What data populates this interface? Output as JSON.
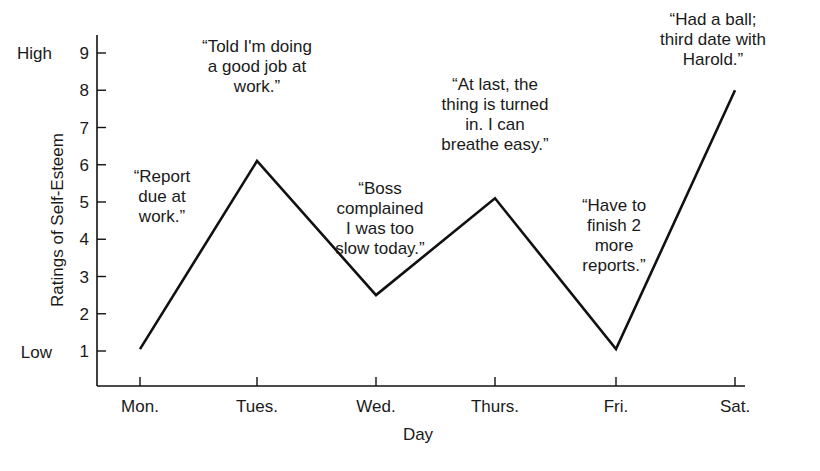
{
  "chart_data": {
    "type": "line",
    "title": "",
    "xlabel": "Day",
    "ylabel": "Ratings of Self-Esteem",
    "categories": [
      "Mon.",
      "Tues.",
      "Wed.",
      "Thurs.",
      "Fri.",
      "Sat."
    ],
    "values": [
      1.05,
      6.1,
      2.5,
      5.1,
      1.05,
      8.0
    ],
    "ylim": [
      0,
      9.8
    ],
    "yticks": [
      1,
      2,
      3,
      4,
      5,
      6,
      7,
      8,
      9
    ],
    "ytick_extra_labels": {
      "1": "Low",
      "9": "High"
    },
    "grid": false,
    "legend": null,
    "annotations": [
      {
        "day": "Mon.",
        "lines": [
          "“Report",
          "due at",
          "work.”"
        ]
      },
      {
        "day": "Tues.",
        "lines": [
          "“Told I'm doing",
          "a good job at",
          "work.”"
        ]
      },
      {
        "day": "Wed.",
        "lines": [
          "“Boss",
          "complained",
          "I was too",
          "slow today.”"
        ]
      },
      {
        "day": "Thurs.",
        "lines": [
          "“At last, the",
          "thing is turned",
          "in. I can",
          "breathe easy.”"
        ]
      },
      {
        "day": "Fri.",
        "lines": [
          "“Have to",
          "finish 2",
          "more",
          "reports.”"
        ]
      },
      {
        "day": "Sat.",
        "lines": [
          "“Had a ball;",
          "third date with",
          "Harold.”"
        ]
      }
    ]
  },
  "labels": {
    "y_high": "High",
    "y_low": "Low"
  }
}
